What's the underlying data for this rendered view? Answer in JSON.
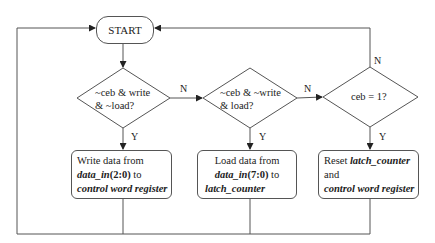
{
  "diagram": {
    "type": "flowchart",
    "start": {
      "label": "START"
    },
    "decisions": [
      {
        "id": "d1",
        "lines": [
          "~ceb & write",
          "& ~load?"
        ],
        "yes_label": "Y",
        "no_label": "N"
      },
      {
        "id": "d2",
        "lines": [
          "~ceb & ~write",
          "& load?"
        ],
        "yes_label": "Y",
        "no_label": "N"
      },
      {
        "id": "d3",
        "lines": [
          "ceb = 1?"
        ],
        "yes_label": "Y",
        "no_label": "N"
      }
    ],
    "actions": [
      {
        "id": "a1",
        "line1": "Write data from",
        "line2_bold_italic": "data_in",
        "line2_bold": "(2:0)",
        "line2_tail": " to",
        "line3_bold_italic": "control word register"
      },
      {
        "id": "a2",
        "line1": "Load data from",
        "line2_bold_italic": "data_in",
        "line2_bold": "(7:0)",
        "line2_tail": " to",
        "line3_bold_italic": "latch_counter"
      },
      {
        "id": "a3",
        "line1_plain": "Reset ",
        "line1_bold_italic": "latch_counter",
        "line2": "and",
        "line3_bold_italic": "control word register"
      }
    ],
    "edges": [
      {
        "from": "START",
        "to": "d1"
      },
      {
        "from": "d1",
        "to": "a1",
        "label": "Y"
      },
      {
        "from": "d1",
        "to": "d2",
        "label": "N"
      },
      {
        "from": "d2",
        "to": "a2",
        "label": "Y"
      },
      {
        "from": "d2",
        "to": "d3",
        "label": "N"
      },
      {
        "from": "d3",
        "to": "a3",
        "label": "Y"
      },
      {
        "from": "d3",
        "to": "START",
        "label": "N"
      },
      {
        "from": "a1",
        "to": "START"
      },
      {
        "from": "a2",
        "to": "START"
      },
      {
        "from": "a3",
        "to": "START"
      }
    ],
    "colors": {
      "line": "#555555",
      "text": "#222222",
      "background": "#ffffff"
    }
  }
}
